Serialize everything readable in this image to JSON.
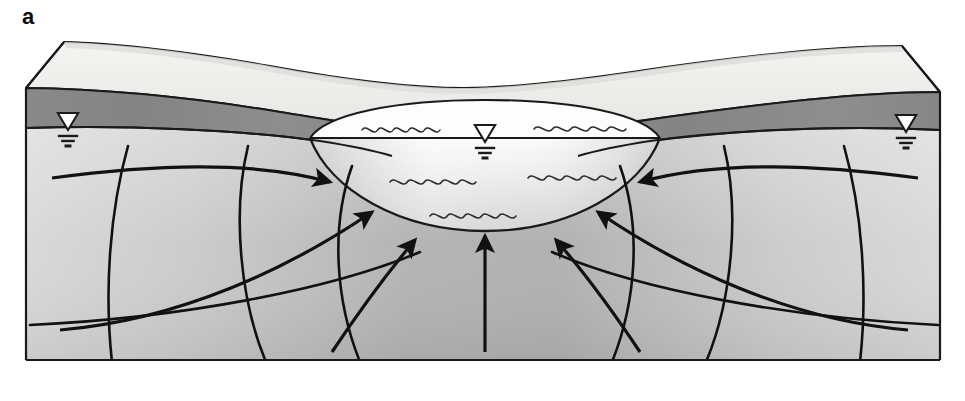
{
  "figure": {
    "panel_label": "a",
    "caption_text": "",
    "title": "",
    "type": "hydrogeologic block diagram"
  },
  "colors": {
    "background": "#ffffff",
    "outline": "#1a1a1a",
    "land_surface_top": "#eeeeec",
    "land_surface_top_shadow": "#e3e3e1",
    "unsaturated_zone": "#8c8c8c",
    "unsaturated_zone_dark": "#7a7a7a",
    "saturated_zone_light": "#d6d6d6",
    "saturated_zone_mid": "#c2c2c2",
    "saturated_zone_dark": "#a8a8a8",
    "lake_surface": "#fdfdfd",
    "lake_body_light": "#f2f2f2",
    "lake_body_mid": "#d9d9d9",
    "flow_line": "#111111",
    "wave_line": "#2b2b2b",
    "water_table_symbol_fill": "#ffffff"
  },
  "geometry": {
    "canvas": {
      "width": 965,
      "height": 401
    },
    "block": {
      "left_edge_x": 26,
      "right_edge_x": 940,
      "front_top_y": 88,
      "bottom_y": 360,
      "back_offset_x": 38,
      "back_offset_y": 46
    },
    "water_table_front_y_left": 128,
    "water_table_front_y_right": 130,
    "lake": {
      "center_x": 485,
      "surface_y": 138,
      "half_width": 175,
      "rim_rise": 22,
      "bottom_depth": 92
    }
  },
  "elements": {
    "land_surface": {
      "name": "land surface (topographic top of block)"
    },
    "unsaturated_zone": {
      "name": "unsaturated zone / vadose zone band"
    },
    "saturated_zone": {
      "name": "saturated zone / aquifer"
    },
    "lake": {
      "name": "lake"
    },
    "lake_water_surface": {
      "name": "lake water surface"
    },
    "block_bottom": {
      "name": "impermeable base of aquifer"
    }
  },
  "water_table_symbols": [
    {
      "id": "wt-left",
      "x": 68,
      "y": 120,
      "size": 17,
      "lines": 3,
      "label": "water table symbol left"
    },
    {
      "id": "wt-lake",
      "x": 485,
      "y": 132,
      "size": 17,
      "lines": 3,
      "label": "water table symbol lake"
    },
    {
      "id": "wt-right",
      "x": 906,
      "y": 122,
      "size": 17,
      "lines": 3,
      "label": "water table symbol right"
    }
  ],
  "flow_arrows": [
    {
      "id": "fa-l1",
      "label": "flow arrow far left upper",
      "path": "M 52,178 C 150,165 250,160 330,182",
      "head_angle": 22
    },
    {
      "id": "fa-l2",
      "label": "flow arrow left mid",
      "path": "M 60,330 C 180,320 290,268 372,212",
      "head_angle": 38
    },
    {
      "id": "fa-l3",
      "label": "flow arrow left inner",
      "path": "M 332,352 C 360,310 388,272 415,240",
      "head_angle": 52
    },
    {
      "id": "fa-c1",
      "label": "flow arrow center vertical",
      "path": "M 485,352 L 485,236",
      "head_angle": 90
    },
    {
      "id": "fa-r3",
      "label": "flow arrow right inner",
      "path": "M 640,352 C 612,310 584,272 556,240",
      "head_angle": 128
    },
    {
      "id": "fa-r2",
      "label": "flow arrow right mid",
      "path": "M 908,330 C 790,320 680,268 598,212",
      "head_angle": 142
    },
    {
      "id": "fa-r1",
      "label": "flow arrow far right upper",
      "path": "M 918,178 C 820,165 720,160 640,182",
      "head_angle": 158
    }
  ],
  "equipotential_lines": [
    {
      "id": "eq-l1",
      "label": "equipotential left outer",
      "path": "M 128,146 C 110,210 104,290 112,362"
    },
    {
      "id": "eq-l2",
      "label": "equipotential left inner",
      "path": "M 248,146 C 232,212 240,300 266,362"
    },
    {
      "id": "eq-l3",
      "label": "equipotential left near-lake",
      "path": "M 352,166 C 330,228 336,302 360,362"
    },
    {
      "id": "eq-r3",
      "label": "equipotential right near-lake",
      "path": "M 620,166 C 642,228 636,302 612,362"
    },
    {
      "id": "eq-r2",
      "label": "equipotential right inner",
      "path": "M 724,146 C 740,212 732,300 706,362"
    },
    {
      "id": "eq-r1",
      "label": "equipotential right outer",
      "path": "M 844,146 C 862,210 868,290 860,362"
    },
    {
      "id": "eq-b1",
      "label": "equipotential band lower left",
      "path": "M 30,325 C 180,318 330,290 420,252"
    },
    {
      "id": "eq-b2",
      "label": "equipotential band lower right",
      "path": "M 938,325 C 790,318 640,290 552,252"
    }
  ],
  "wave_marks": [
    {
      "id": "wv-1",
      "label": "lake wave mark upper left",
      "x": 362,
      "y": 130,
      "w": 78,
      "amp": 3.4
    },
    {
      "id": "wv-2",
      "label": "lake wave mark upper right",
      "x": 534,
      "y": 129,
      "w": 92,
      "amp": 3.4
    },
    {
      "id": "wv-3",
      "label": "lake wave mark mid left",
      "x": 390,
      "y": 182,
      "w": 86,
      "amp": 3.6
    },
    {
      "id": "wv-4",
      "label": "lake wave mark mid right",
      "x": 528,
      "y": 178,
      "w": 88,
      "amp": 3.6
    },
    {
      "id": "wv-5",
      "label": "lake wave mark lower center",
      "x": 430,
      "y": 216,
      "w": 86,
      "amp": 3.6
    }
  ]
}
